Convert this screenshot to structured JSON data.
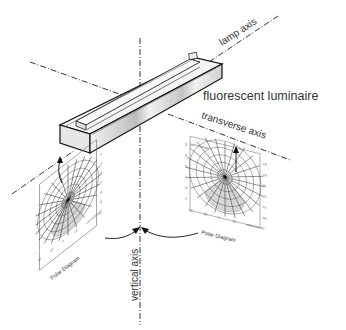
{
  "diagram": {
    "luminaire_label": "fluorescent luminaire",
    "axes": {
      "lamp": "lamp axis",
      "transverse": "transverse axis",
      "vertical": "vertical axis"
    },
    "polar_diagrams": [
      {
        "id": "lamp-plane",
        "caption": "Polar Diagram",
        "header": "gamma angle",
        "left_ticks": [
          "105",
          "90",
          "75",
          "60",
          "45",
          "30"
        ],
        "right_ticks": [
          "120",
          "105",
          "90",
          "75",
          "60",
          "45"
        ],
        "bottom_ticks": [
          "30",
          "15",
          "0",
          "15",
          "cd/1000lm",
          "30"
        ]
      },
      {
        "id": "transverse-plane",
        "caption": "Polar Diagram",
        "header": "gamma angle",
        "left_ticks": [
          "105",
          "90",
          "75",
          "60",
          "45",
          "30"
        ],
        "right_ticks": [
          "120",
          "105",
          "90",
          "75",
          "60",
          "45"
        ],
        "bottom_ticks": [
          "30",
          "15",
          "0",
          "15",
          "cd/1000lm",
          "30"
        ]
      }
    ],
    "colors": {
      "line": "#222222",
      "lobe_fill": "#d6d6d6",
      "luminaire_face": "#f0f0f0",
      "luminaire_shade": "#bdbdbd"
    }
  }
}
